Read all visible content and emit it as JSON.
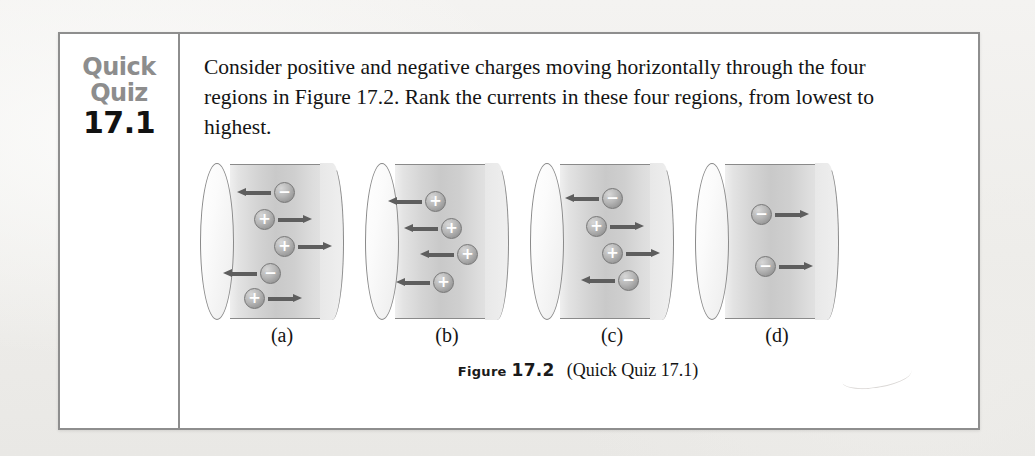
{
  "quiz": {
    "label_line1": "Quick",
    "label_line2": "Quiz",
    "number": "17.1",
    "prompt": "Consider positive and negative charges moving horizontally through the four regions in Figure 17.2. Rank the currents in these four regions, from lowest to highest."
  },
  "caption": {
    "figure_word": "Figure",
    "figure_number": "17.2",
    "reference": "(Quick Quiz 17.1)"
  },
  "colors": {
    "box_border": "#8e8e8e",
    "label_grey": "#8d8d8d",
    "number_black": "#121212",
    "arrow_grey": "#5e5e5e",
    "charge_grey": "#a8a8a8",
    "page_background": "#f1f0ee",
    "box_background": "#ffffff"
  },
  "figure": {
    "regions": [
      {
        "label": "(a)",
        "charges": [
          {
            "sign": "−",
            "direction": "left",
            "x": 58,
            "y": 18
          },
          {
            "sign": "+",
            "direction": "right",
            "x": 38,
            "y": 45
          },
          {
            "sign": "+",
            "direction": "right",
            "x": 58,
            "y": 72
          },
          {
            "sign": "−",
            "direction": "left",
            "x": 44,
            "y": 99
          },
          {
            "sign": "+",
            "direction": "right",
            "x": 28,
            "y": 124
          }
        ]
      },
      {
        "label": "(b)",
        "charges": [
          {
            "sign": "+",
            "direction": "left",
            "x": 44,
            "y": 27
          },
          {
            "sign": "+",
            "direction": "left",
            "x": 60,
            "y": 54
          },
          {
            "sign": "+",
            "direction": "left",
            "x": 76,
            "y": 80
          },
          {
            "sign": "+",
            "direction": "left",
            "x": 52,
            "y": 108
          }
        ]
      },
      {
        "label": "(c)",
        "charges": [
          {
            "sign": "−",
            "direction": "left",
            "x": 56,
            "y": 24
          },
          {
            "sign": "+",
            "direction": "right",
            "x": 40,
            "y": 52
          },
          {
            "sign": "+",
            "direction": "right",
            "x": 56,
            "y": 79
          },
          {
            "sign": "−",
            "direction": "left",
            "x": 72,
            "y": 106
          }
        ]
      },
      {
        "label": "(d)",
        "charges": [
          {
            "sign": "−",
            "direction": "right",
            "x": 40,
            "y": 40
          },
          {
            "sign": "−",
            "direction": "right",
            "x": 44,
            "y": 92
          }
        ]
      }
    ]
  }
}
